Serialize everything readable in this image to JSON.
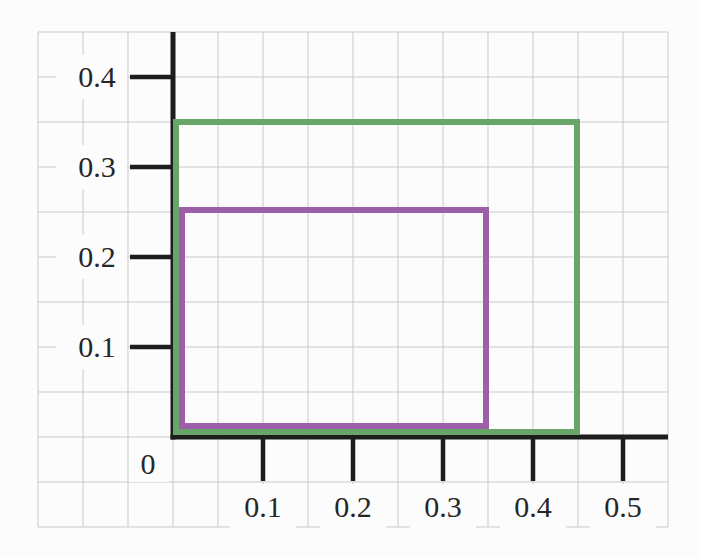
{
  "figure": {
    "background_color": "#fcfcfc",
    "grid_color": "#c9c9c9",
    "axis_color": "#1d1d1d",
    "label_color": "#262626",
    "label_font_size_px": 30
  },
  "chart_data": {
    "type": "rectangles",
    "title": "",
    "grid": true,
    "grid_step": 0.05,
    "x_axis": {
      "range": [
        -0.15,
        0.55
      ],
      "ticks": [
        0.1,
        0.2,
        0.3,
        0.4,
        0.5
      ],
      "tick_labels": [
        "0.1",
        "0.2",
        "0.3",
        "0.4",
        "0.5"
      ]
    },
    "y_axis": {
      "range": [
        -0.1,
        0.45
      ],
      "ticks": [
        0.1,
        0.2,
        0.3,
        0.4
      ],
      "tick_labels": [
        "0.1",
        "0.2",
        "0.3",
        "0.4"
      ]
    },
    "origin_label": "0",
    "rectangles": [
      {
        "name": "green-rectangle",
        "x": 0,
        "y": 0,
        "width": 0.45,
        "height": 0.35,
        "stroke_color": "#67a568",
        "stroke_width_px": 6
      },
      {
        "name": "purple-rectangle",
        "x": 0,
        "y": 0,
        "width": 0.35,
        "height": 0.25,
        "stroke_color": "#9d5fa8",
        "stroke_width_px": 6
      }
    ]
  }
}
